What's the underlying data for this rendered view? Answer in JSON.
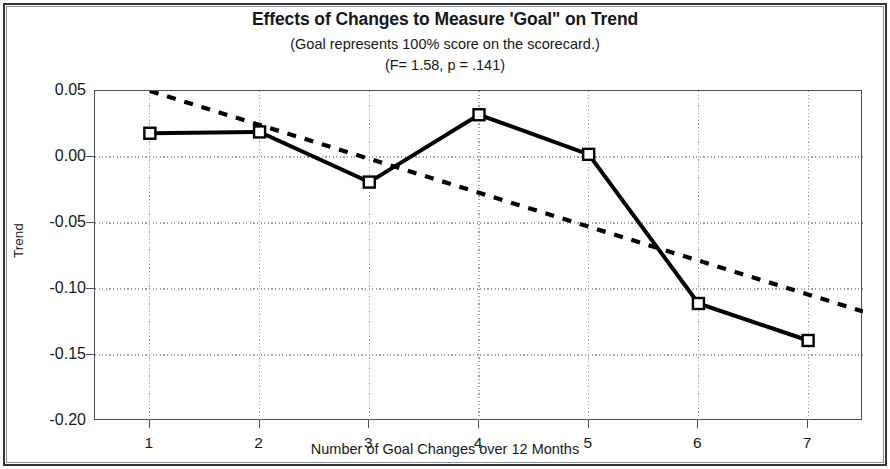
{
  "chart_data": {
    "type": "line",
    "title": "Effects of Changes to Measure 'Goal\" on Trend",
    "subtitle": "(Goal represents 100% score on the scorecard.)",
    "subtitle2": "(F= 1.58, p = .141)",
    "xlabel": "Number of Goal Changes over 12 Months",
    "ylabel": "Trend",
    "categories": [
      "1",
      "2",
      "3",
      "4",
      "5",
      "6",
      "7"
    ],
    "x": [
      1,
      2,
      3,
      4,
      5,
      6,
      7
    ],
    "xlim": [
      0.5,
      7.5
    ],
    "ylim": [
      -0.2,
      0.05
    ],
    "yticks": [
      0.05,
      0.0,
      -0.05,
      -0.1,
      -0.15,
      -0.2
    ],
    "ytick_labels": [
      "0.05",
      "0.00",
      "-0.05",
      "-0.10",
      "-0.15",
      "-0.20"
    ],
    "grid": true,
    "grid_style": "dotted",
    "legend": "none",
    "series": [
      {
        "name": "Trend",
        "style": "solid",
        "marker": "open-square",
        "color": "#000000",
        "values": [
          0.018,
          0.019,
          -0.019,
          0.032,
          0.002,
          -0.111,
          -0.139
        ]
      },
      {
        "name": "Linear trendline",
        "style": "dashed",
        "marker": "none",
        "color": "#000000",
        "endpoints": [
          {
            "x": 1.0,
            "y": 0.05
          },
          {
            "x": 7.5,
            "y": -0.117
          }
        ]
      }
    ]
  },
  "colors": {
    "line": "#000000",
    "axis": "#4c5157",
    "grid": "#9aa0a6",
    "text": "#16181b",
    "frame": "#32363c",
    "background": "#ffffff"
  }
}
